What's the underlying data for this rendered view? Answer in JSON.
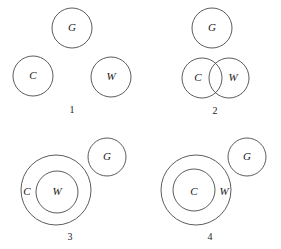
{
  "figure": {
    "background_color": "#ffffff",
    "stroke_color": "#4a4a4a",
    "text_color": "#1a1a1a",
    "width": 281,
    "height": 249
  },
  "legend_keys": {
    "C": "C",
    "W": "W",
    "G": "G"
  },
  "panels": [
    {
      "number": "1",
      "number_x": 72,
      "number_y": 111,
      "relation": "C, W and G all disjoint",
      "circles": [
        {
          "label": "G",
          "cx": 72,
          "cy": 28,
          "r": 20,
          "label_x": 72,
          "label_y": 28
        },
        {
          "label": "C",
          "cx": 33,
          "cy": 76,
          "r": 20,
          "label_x": 33,
          "label_y": 76
        },
        {
          "label": "W",
          "cx": 111,
          "cy": 77,
          "r": 20,
          "label_x": 111,
          "label_y": 77
        }
      ]
    },
    {
      "number": "2",
      "number_x": 215,
      "number_y": 112,
      "relation": "C and W overlap; G disjoint",
      "circles": [
        {
          "label": "G",
          "cx": 212,
          "cy": 28,
          "r": 20,
          "label_x": 212,
          "label_y": 28
        },
        {
          "label": "C",
          "cx": 202,
          "cy": 78,
          "r": 20,
          "label_x": 198,
          "label_y": 78
        },
        {
          "label": "W",
          "cx": 229,
          "cy": 78,
          "r": 20,
          "label_x": 233,
          "label_y": 78
        }
      ]
    },
    {
      "number": "3",
      "number_x": 70,
      "number_y": 238,
      "relation": "W inside C; G disjoint",
      "circles": [
        {
          "label": "C",
          "cx": 56,
          "cy": 190,
          "r": 35,
          "label_x": 27,
          "label_y": 192
        },
        {
          "label": "W",
          "cx": 57,
          "cy": 192,
          "r": 21,
          "label_x": 57,
          "label_y": 192
        },
        {
          "label": "G",
          "cx": 107,
          "cy": 157,
          "r": 19,
          "label_x": 107,
          "label_y": 157
        }
      ]
    },
    {
      "number": "4",
      "number_x": 210,
      "number_y": 238,
      "relation": "C inside W; G disjoint",
      "circles": [
        {
          "label": "W",
          "cx": 196,
          "cy": 190,
          "r": 35,
          "label_x": 224,
          "label_y": 192
        },
        {
          "label": "C",
          "cx": 194,
          "cy": 190,
          "r": 21,
          "label_x": 194,
          "label_y": 192
        },
        {
          "label": "G",
          "cx": 247,
          "cy": 157,
          "r": 19,
          "label_x": 247,
          "label_y": 157
        }
      ]
    }
  ]
}
